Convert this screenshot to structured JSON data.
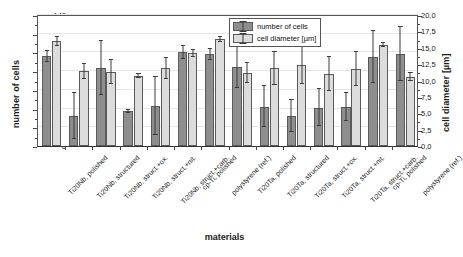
{
  "chart_data": {
    "type": "bar",
    "title": "",
    "xlabel": "materials",
    "ylabel": "number of cells",
    "y2label": "cell diameter [µm]",
    "ylim": [
      0,
      140
    ],
    "y2lim": [
      0.0,
      20.0
    ],
    "yticks": [
      "0",
      "20",
      "40",
      "60",
      "80",
      "100",
      "120",
      "140"
    ],
    "y2ticks": [
      "0,0",
      "2,5",
      "5,0",
      "7,5",
      "10,0",
      "12,5",
      "15,0",
      "17,5",
      "20,0"
    ],
    "grid": true,
    "legend_position": "top-center-right",
    "categories": [
      "Ti20Nb, polished",
      "Ti20Nb, structured",
      "Ti20Nb, struct.+ox.",
      "Ti20Nb, struct.+nit.",
      "Ti20Nb, struct.+carb.",
      "cp-Ti, polished",
      "polystyrene (ref.)",
      "Ti20Ta, polished",
      "Ti20Ta, structured",
      "Ti20Ta, struct.+ox.",
      "Ti20Ta, struct.+nit.",
      "Ti20Ta, struct.+carb.",
      "cp-Ti, polished",
      "polystyrene (ref.)"
    ],
    "series": [
      {
        "name": "number of cells",
        "axis": "left",
        "color": "#8e8e8e",
        "values": [
          96,
          32,
          83,
          37,
          43,
          100,
          98,
          84,
          42,
          32,
          41,
          42,
          95,
          98
        ],
        "errors": [
          6,
          25,
          29,
          2,
          31,
          7,
          6,
          22,
          22,
          17,
          20,
          15,
          28,
          29
        ]
      },
      {
        "name": "cell diameter [µm]",
        "axis": "right",
        "color": "#dcdcdc",
        "values_right_units": [
          15.0,
          10.7,
          10.6,
          10.0,
          11.1,
          13.3,
          15.3,
          10.5,
          11.1,
          11.7,
          10.3,
          11.0,
          14.5,
          9.9
        ],
        "values_left_scale": [
          112,
          80,
          79,
          75,
          83,
          99,
          114,
          78,
          83,
          87,
          77,
          82,
          108,
          74
        ],
        "errors_left_scale": [
          5,
          8,
          13,
          2,
          11,
          4,
          3,
          11,
          18,
          21,
          18,
          18,
          2,
          4
        ]
      }
    ]
  }
}
